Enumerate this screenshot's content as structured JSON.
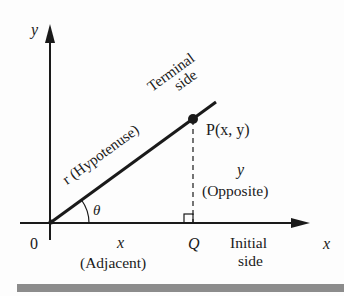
{
  "diagram": {
    "axes": {
      "y_label": "y",
      "x_label": "x",
      "origin_label": "0"
    },
    "terminal_side": {
      "line1": "Terminal",
      "line2": "side"
    },
    "hypotenuse_label": "r (Hypotenuse)",
    "angle_label": "θ",
    "point_p_label": "P(x, y)",
    "opposite": {
      "var": "y",
      "label": "(Opposite)"
    },
    "adjacent": {
      "var": "x",
      "label": "(Adjacent)"
    },
    "point_q_label": "Q",
    "initial_side": {
      "line1": "Initial",
      "line2": "side"
    },
    "colors": {
      "ink": "#1a1a1a",
      "bar": "#8c8c8c"
    }
  }
}
